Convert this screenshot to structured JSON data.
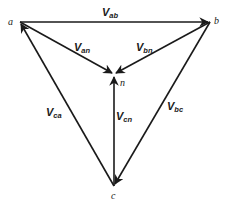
{
  "diagram": {
    "nodes": [
      {
        "id": "a",
        "label": "a",
        "x": 20,
        "y": 22
      },
      {
        "id": "b",
        "label": "b",
        "x": 210,
        "y": 22
      },
      {
        "id": "n",
        "label": "n",
        "x": 114,
        "y": 75
      },
      {
        "id": "c",
        "label": "c",
        "x": 114,
        "y": 186
      }
    ],
    "edges": [
      {
        "id": "ab",
        "from": "a",
        "to": "b",
        "label": "V",
        "sub": "ab"
      },
      {
        "id": "an",
        "from": "a",
        "to": "n",
        "label": "V",
        "sub": "an"
      },
      {
        "id": "bn",
        "from": "b",
        "to": "n",
        "label": "V",
        "sub": "bn"
      },
      {
        "id": "cn",
        "from": "c",
        "to": "n",
        "label": "V",
        "sub": "cn"
      },
      {
        "id": "ca",
        "from": "c",
        "to": "a",
        "label": "V",
        "sub": "ca"
      },
      {
        "id": "bc",
        "from": "b",
        "to": "c",
        "label": "V",
        "sub": "bc"
      }
    ],
    "colors": {
      "line": "#1a1a1a",
      "background": "#ffffff"
    }
  }
}
